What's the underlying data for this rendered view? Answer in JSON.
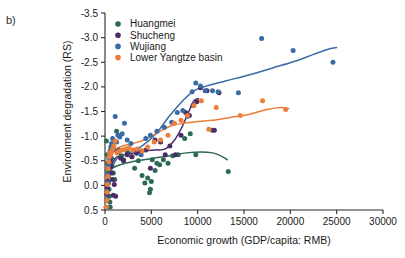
{
  "panel": {
    "label": "b)"
  },
  "chart_data": {
    "type": "scatter",
    "title": "",
    "xlabel": "Economic growth (GDP/capita: RMB)",
    "ylabel": "Environment degradation (RS)",
    "xlim": [
      0,
      30000
    ],
    "ylim": [
      0.5,
      -3.5
    ],
    "y_inverted": true,
    "grid": false,
    "legend_position": "top-left-inside",
    "xticks": [
      0,
      5000,
      10000,
      15000,
      20000,
      25000,
      30000
    ],
    "xticklabels": [
      "0",
      "5000",
      "10000",
      "15000",
      "20000",
      "25000",
      "30000"
    ],
    "yticks": [
      -3.5,
      -3.0,
      -2.5,
      -2.0,
      -1.5,
      -1.0,
      -0.5,
      0.0,
      0.5
    ],
    "yticklabels": [
      "-3.5",
      "-3.0",
      "-2.5",
      "-2.0",
      "-1.5",
      "-1.0",
      "-0.5",
      "0.0",
      "0.5"
    ],
    "series": [
      {
        "name": "Huangmei",
        "color": "#2d6a55",
        "points": [
          [
            150,
            -0.9
          ],
          [
            210,
            -0.62
          ],
          [
            260,
            -0.45
          ],
          [
            300,
            -0.3
          ],
          [
            340,
            -0.18
          ],
          [
            380,
            -0.05
          ],
          [
            430,
            0.08
          ],
          [
            470,
            0.22
          ],
          [
            520,
            0.34
          ],
          [
            560,
            0.44
          ],
          [
            700,
            -0.55
          ],
          [
            760,
            -0.4
          ],
          [
            900,
            -0.25
          ],
          [
            1050,
            -0.12
          ],
          [
            1250,
            -1.1
          ],
          [
            1500,
            -0.72
          ],
          [
            1750,
            -0.6
          ],
          [
            2000,
            -0.52
          ],
          [
            2400,
            -0.68
          ],
          [
            2900,
            -0.58
          ],
          [
            3200,
            -0.35
          ],
          [
            3600,
            -0.5
          ],
          [
            4000,
            -0.2
          ],
          [
            4300,
            -0.05
          ],
          [
            4600,
            -0.15
          ],
          [
            4900,
            0.08
          ],
          [
            5100,
            -0.52
          ],
          [
            5400,
            -0.3
          ],
          [
            5600,
            -0.45
          ],
          [
            5900,
            -0.42
          ],
          [
            6300,
            -0.52
          ],
          [
            6800,
            -0.45
          ],
          [
            7300,
            -0.6
          ],
          [
            7900,
            -0.62
          ],
          [
            8600,
            -0.95
          ],
          [
            9200,
            -1.05
          ],
          [
            9800,
            -0.62
          ],
          [
            11600,
            -1.12
          ],
          [
            13300,
            -0.28
          ],
          [
            4800,
            0.15
          ],
          [
            5000,
            -0.08
          ]
        ],
        "trend": [
          [
            120,
            -0.18
          ],
          [
            900,
            -0.36
          ],
          [
            2000,
            -0.44
          ],
          [
            3500,
            -0.5
          ],
          [
            5200,
            -0.55
          ],
          [
            7000,
            -0.6
          ],
          [
            8800,
            -0.66
          ],
          [
            10400,
            -0.68
          ],
          [
            11600,
            -0.66
          ],
          [
            12500,
            -0.6
          ],
          [
            13200,
            -0.52
          ]
        ]
      },
      {
        "name": "Shucheng",
        "color": "#4b2a66",
        "points": [
          [
            130,
            0.45
          ],
          [
            170,
            0.3
          ],
          [
            200,
            0.18
          ],
          [
            240,
            0.05
          ],
          [
            280,
            -0.08
          ],
          [
            320,
            -0.22
          ],
          [
            360,
            -0.35
          ],
          [
            400,
            -0.46
          ],
          [
            450,
            -0.55
          ],
          [
            500,
            -0.62
          ],
          [
            560,
            -0.5
          ],
          [
            620,
            -0.38
          ],
          [
            700,
            -0.25
          ],
          [
            780,
            -0.12
          ],
          [
            900,
            0.2
          ],
          [
            1000,
            -0.02
          ],
          [
            1150,
            0.22
          ],
          [
            1400,
            -0.68
          ],
          [
            1700,
            -0.55
          ],
          [
            2000,
            -0.5
          ],
          [
            2400,
            -0.62
          ],
          [
            2900,
            -0.58
          ],
          [
            3400,
            -0.65
          ],
          [
            3900,
            -0.7
          ],
          [
            4400,
            -0.72
          ],
          [
            4900,
            -0.35
          ],
          [
            5400,
            -0.92
          ],
          [
            6000,
            -0.88
          ],
          [
            6500,
            -0.62
          ],
          [
            7000,
            -0.8
          ],
          [
            7600,
            -0.62
          ],
          [
            8200,
            -1.02
          ],
          [
            8700,
            -1.48
          ],
          [
            9100,
            -1.42
          ],
          [
            9500,
            -1.62
          ],
          [
            9900,
            -1.7
          ],
          [
            10300,
            -1.98
          ],
          [
            11000,
            -1.92
          ],
          [
            11800,
            -1.12
          ],
          [
            12300,
            -1.88
          ]
        ],
        "trend": [
          [
            150,
            0.18
          ],
          [
            500,
            -0.28
          ],
          [
            1100,
            -0.55
          ],
          [
            2000,
            -0.62
          ],
          [
            3200,
            -0.66
          ],
          [
            4300,
            -0.7
          ],
          [
            5400,
            -0.72
          ],
          [
            6500,
            -0.74
          ],
          [
            7500,
            -0.92
          ],
          [
            8300,
            -1.18
          ],
          [
            9000,
            -1.48
          ],
          [
            9600,
            -1.72
          ],
          [
            10100,
            -1.76
          ]
        ]
      },
      {
        "name": "Wujiang",
        "color": "#3a6ba5",
        "points": [
          [
            140,
            0.45
          ],
          [
            180,
            0.28
          ],
          [
            220,
            0.12
          ],
          [
            270,
            -0.05
          ],
          [
            320,
            -0.22
          ],
          [
            370,
            -0.4
          ],
          [
            420,
            -0.55
          ],
          [
            480,
            -0.62
          ],
          [
            540,
            -0.7
          ],
          [
            620,
            -0.78
          ],
          [
            720,
            -0.85
          ],
          [
            820,
            -0.95
          ],
          [
            950,
            -0.72
          ],
          [
            1100,
            -1.4
          ],
          [
            1250,
            -0.88
          ],
          [
            1400,
            -1.02
          ],
          [
            1600,
            -0.98
          ],
          [
            1850,
            -1.05
          ],
          [
            2100,
            -1.26
          ],
          [
            2400,
            -0.92
          ],
          [
            2800,
            -0.85
          ],
          [
            3300,
            -0.72
          ],
          [
            3900,
            -0.62
          ],
          [
            4400,
            -0.95
          ],
          [
            4900,
            -1.02
          ],
          [
            5600,
            -1.1
          ],
          [
            6400,
            -1.18
          ],
          [
            7200,
            -1.28
          ],
          [
            7800,
            -1.48
          ],
          [
            8400,
            -1.52
          ],
          [
            8900,
            -1.4
          ],
          [
            9400,
            -1.9
          ],
          [
            9800,
            -2.08
          ],
          [
            10300,
            -2.02
          ],
          [
            10800,
            -1.92
          ],
          [
            11600,
            -1.92
          ],
          [
            12200,
            -1.9
          ],
          [
            14400,
            -1.88
          ],
          [
            16900,
            -2.98
          ],
          [
            20300,
            -2.74
          ],
          [
            24600,
            -2.5
          ]
        ],
        "trend": [
          [
            180,
            -0.1
          ],
          [
            1200,
            -0.52
          ],
          [
            2600,
            -0.66
          ],
          [
            4000,
            -0.8
          ],
          [
            5500,
            -1.05
          ],
          [
            7000,
            -1.42
          ],
          [
            8400,
            -1.72
          ],
          [
            9600,
            -1.92
          ],
          [
            11000,
            -2.02
          ],
          [
            13000,
            -2.12
          ],
          [
            15500,
            -2.24
          ],
          [
            18000,
            -2.38
          ],
          [
            20500,
            -2.52
          ],
          [
            22500,
            -2.66
          ],
          [
            24000,
            -2.76
          ],
          [
            25000,
            -2.8
          ]
        ]
      },
      {
        "name": "Lower Yangtze basin",
        "color": "#ed7d3a",
        "points": [
          [
            140,
            0.44
          ],
          [
            180,
            0.3
          ],
          [
            220,
            0.14
          ],
          [
            260,
            -0.02
          ],
          [
            300,
            -0.18
          ],
          [
            350,
            -0.34
          ],
          [
            400,
            -0.48
          ],
          [
            460,
            -0.58
          ],
          [
            520,
            -0.66
          ],
          [
            600,
            -0.62
          ],
          [
            700,
            -0.68
          ],
          [
            820,
            -0.74
          ],
          [
            950,
            -0.8
          ],
          [
            1100,
            -0.9
          ],
          [
            1300,
            -0.66
          ],
          [
            1550,
            -0.7
          ],
          [
            1850,
            -0.72
          ],
          [
            2200,
            -0.74
          ],
          [
            2600,
            -0.76
          ],
          [
            3000,
            -0.72
          ],
          [
            3500,
            -0.74
          ],
          [
            4000,
            -0.7
          ],
          [
            4600,
            -0.78
          ],
          [
            5300,
            -0.88
          ],
          [
            6000,
            -0.92
          ],
          [
            6800,
            -1.02
          ],
          [
            7500,
            -1.26
          ],
          [
            8200,
            -1.32
          ],
          [
            8900,
            -1.42
          ],
          [
            9600,
            -1.62
          ],
          [
            10400,
            -1.72
          ],
          [
            11200,
            -1.14
          ],
          [
            12000,
            -1.58
          ],
          [
            14600,
            -1.42
          ],
          [
            17000,
            -1.72
          ],
          [
            19500,
            -1.54
          ]
        ],
        "trend": [
          [
            150,
            -0.05
          ],
          [
            700,
            -0.62
          ],
          [
            1600,
            -0.78
          ],
          [
            2800,
            -0.84
          ],
          [
            4200,
            -0.92
          ],
          [
            5600,
            -1.06
          ],
          [
            7000,
            -1.2
          ],
          [
            8400,
            -1.26
          ],
          [
            9800,
            -1.29
          ],
          [
            11500,
            -1.32
          ],
          [
            13500,
            -1.38
          ],
          [
            15500,
            -1.44
          ],
          [
            17500,
            -1.54
          ],
          [
            19000,
            -1.58
          ],
          [
            19800,
            -1.56
          ]
        ]
      }
    ]
  }
}
